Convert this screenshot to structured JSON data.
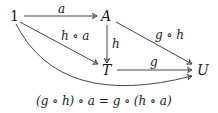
{
  "nodes": {
    "one": "1",
    "A": "A",
    "T": "T",
    "U": "U"
  },
  "arrows": {
    "one_to_A": "a",
    "one_to_T": "h ∘ a",
    "A_to_T": "h",
    "A_to_U": "g ∘ h",
    "T_to_U": "g",
    "one_to_U": ""
  },
  "caption": "(g ∘ h) ∘ a = g ∘ (h ∘ a)",
  "colors": {
    "stroke": "#333333",
    "text": "#1a1a1a"
  }
}
